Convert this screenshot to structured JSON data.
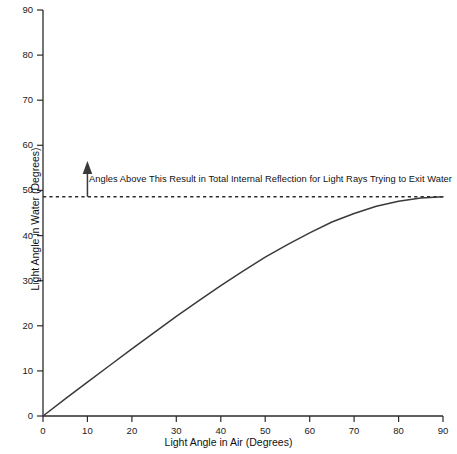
{
  "chart_data": {
    "type": "line",
    "title": "",
    "xlabel": "Light Angle in Air (Degrees)",
    "ylabel": "Light Angle in Water (Degrees)",
    "xlim": [
      0,
      90
    ],
    "ylim": [
      0,
      90
    ],
    "grid": false,
    "legend": null,
    "xticks": [
      0,
      10,
      20,
      30,
      40,
      50,
      60,
      70,
      80,
      90
    ],
    "yticks": [
      0,
      10,
      20,
      30,
      40,
      50,
      60,
      70,
      80,
      90
    ],
    "xtick_labels": [
      "0",
      "10",
      "20",
      "30",
      "40",
      "50",
      "60",
      "70",
      "80",
      "90"
    ],
    "ytick_labels": [
      "0",
      "10",
      "20",
      "30",
      "40",
      "50",
      "60",
      "70",
      "80",
      "90"
    ],
    "series": [
      {
        "name": "Refracted angle in water",
        "color": "#3a3a3a",
        "style": "solid",
        "x": [
          0,
          5,
          10,
          15,
          20,
          25,
          30,
          35,
          40,
          45,
          50,
          55,
          60,
          65,
          70,
          75,
          80,
          85,
          90
        ],
        "values": [
          0.0,
          3.8,
          7.5,
          11.2,
          14.9,
          18.5,
          22.1,
          25.5,
          28.9,
          32.1,
          35.2,
          38.0,
          40.6,
          43.0,
          44.9,
          46.5,
          47.6,
          48.3,
          48.6
        ]
      }
    ],
    "annotations": [
      {
        "name": "critical-angle-line",
        "type": "hline",
        "y": 48.6,
        "style": "dashed",
        "color": "#2a2a2a"
      },
      {
        "name": "critical-angle-arrow",
        "type": "arrow",
        "x": 10,
        "y_start": 48.6,
        "y_end": 56.5,
        "direction": "up",
        "color": "#3a3a3a"
      }
    ],
    "annotation_text": "Angles Above This Result in Total Internal Reflection for Light Rays Trying to Exit Water"
  },
  "colors": {
    "background": "#ffffff",
    "axis": "#2b2b2b",
    "curve": "#3a3a3a",
    "dashed": "#2a2a2a",
    "text": "#111111"
  }
}
